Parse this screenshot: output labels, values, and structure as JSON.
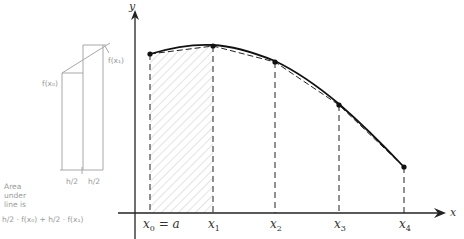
{
  "diagram": {
    "axes": {
      "x_label": "x",
      "y_label": "y",
      "origin_px": [
        135,
        213
      ]
    },
    "points": [
      {
        "label": "x0 = a",
        "sub": "0",
        "base": "x",
        "suffix": " = a",
        "px": [
          150,
          54
        ]
      },
      {
        "label": "x1",
        "sub": "1",
        "base": "x",
        "suffix": "",
        "px": [
          213,
          46
        ]
      },
      {
        "label": "x2",
        "sub": "2",
        "base": "x",
        "suffix": "",
        "px": [
          275,
          62
        ]
      },
      {
        "label": "x3",
        "sub": "3",
        "base": "x",
        "suffix": "",
        "px": [
          339,
          105
        ]
      },
      {
        "label": "x4",
        "sub": "4",
        "base": "x",
        "suffix": "",
        "px": [
          404,
          167
        ]
      }
    ],
    "shaded_region": {
      "from": "x0",
      "to": "x1",
      "style": "hatched"
    },
    "colors": {
      "ink": "#222222",
      "pencil": "#9a9a9a",
      "hatch": "#c8c8c8"
    }
  },
  "sketch": {
    "label_fx0": "f(x₀)",
    "label_fx1": "f(x₁)",
    "half_h_left": "h/2",
    "half_h_right": "h/2",
    "note_line1": "Area",
    "note_line2": "under",
    "note_line3": "line is",
    "formula": "h/2 · f(x₀) + h/2 · f(x₁)"
  }
}
